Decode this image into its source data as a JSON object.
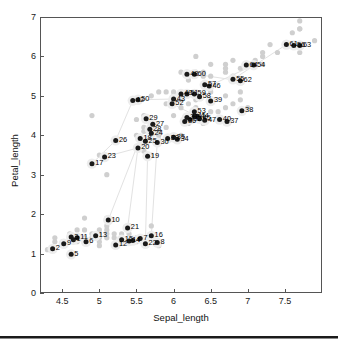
{
  "chart_data": {
    "type": "scatter",
    "title": "",
    "xlabel": "Sepal_length",
    "ylabel": "Petal_length",
    "xlim": [
      4.2,
      8.0
    ],
    "ylim": [
      0,
      7
    ],
    "xticks": [
      4.5,
      5,
      5.5,
      6,
      6.5,
      7,
      7.5
    ],
    "xtick_labels": [
      "4.5",
      "5",
      "5.5",
      "6",
      "6.5",
      "7",
      "7.5"
    ],
    "yticks": [
      0,
      1,
      2,
      3,
      4,
      5,
      6,
      7
    ],
    "ytick_labels": [
      "0",
      "1",
      "2",
      "3",
      "4",
      "5",
      "6",
      "7"
    ],
    "grid": false,
    "legend": "none",
    "colors": {
      "foreground_point": "#1a1a1a",
      "background_point": "#cfcfcf",
      "link_line": "#e2e2e2",
      "axis": "#555555",
      "text": "#111111"
    },
    "series": [
      {
        "name": "background_points",
        "marker": "filled-circle",
        "color": "#cfcfcf",
        "points": [
          {
            "x": 4.3,
            "y": 1.1
          },
          {
            "x": 4.4,
            "y": 1.3
          },
          {
            "x": 4.4,
            "y": 1.4
          },
          {
            "x": 4.5,
            "y": 1.3
          },
          {
            "x": 4.6,
            "y": 1.0
          },
          {
            "x": 4.6,
            "y": 1.4
          },
          {
            "x": 4.6,
            "y": 1.5
          },
          {
            "x": 4.7,
            "y": 1.3
          },
          {
            "x": 4.7,
            "y": 1.6
          },
          {
            "x": 4.8,
            "y": 1.4
          },
          {
            "x": 4.8,
            "y": 1.6
          },
          {
            "x": 4.8,
            "y": 1.9
          },
          {
            "x": 4.9,
            "y": 1.4
          },
          {
            "x": 4.9,
            "y": 1.5
          },
          {
            "x": 4.9,
            "y": 3.3
          },
          {
            "x": 4.9,
            "y": 4.5
          },
          {
            "x": 5.0,
            "y": 1.2
          },
          {
            "x": 5.0,
            "y": 1.3
          },
          {
            "x": 5.0,
            "y": 1.4
          },
          {
            "x": 5.0,
            "y": 1.5
          },
          {
            "x": 5.0,
            "y": 1.6
          },
          {
            "x": 5.0,
            "y": 3.5
          },
          {
            "x": 5.1,
            "y": 1.4
          },
          {
            "x": 5.1,
            "y": 1.5
          },
          {
            "x": 5.1,
            "y": 1.6
          },
          {
            "x": 5.1,
            "y": 1.7
          },
          {
            "x": 5.1,
            "y": 1.9
          },
          {
            "x": 5.1,
            "y": 3.0
          },
          {
            "x": 5.2,
            "y": 1.4
          },
          {
            "x": 5.2,
            "y": 1.5
          },
          {
            "x": 5.2,
            "y": 3.9
          },
          {
            "x": 5.3,
            "y": 1.5
          },
          {
            "x": 5.4,
            "y": 1.3
          },
          {
            "x": 5.4,
            "y": 1.5
          },
          {
            "x": 5.4,
            "y": 1.7
          },
          {
            "x": 5.5,
            "y": 1.3
          },
          {
            "x": 5.5,
            "y": 1.4
          },
          {
            "x": 5.5,
            "y": 3.7
          },
          {
            "x": 5.5,
            "y": 4.0
          },
          {
            "x": 5.5,
            "y": 4.4
          },
          {
            "x": 5.6,
            "y": 3.6
          },
          {
            "x": 5.6,
            "y": 4.1
          },
          {
            "x": 5.6,
            "y": 4.2
          },
          {
            "x": 5.6,
            "y": 4.5
          },
          {
            "x": 5.7,
            "y": 1.5
          },
          {
            "x": 5.7,
            "y": 1.7
          },
          {
            "x": 5.7,
            "y": 3.5
          },
          {
            "x": 5.7,
            "y": 4.1
          },
          {
            "x": 5.7,
            "y": 4.2
          },
          {
            "x": 5.7,
            "y": 5.0
          },
          {
            "x": 5.8,
            "y": 1.2
          },
          {
            "x": 5.8,
            "y": 3.9
          },
          {
            "x": 5.8,
            "y": 4.0
          },
          {
            "x": 5.8,
            "y": 4.1
          },
          {
            "x": 5.8,
            "y": 5.1
          },
          {
            "x": 5.9,
            "y": 4.2
          },
          {
            "x": 5.9,
            "y": 4.8
          },
          {
            "x": 5.9,
            "y": 5.1
          },
          {
            "x": 6.0,
            "y": 4.0
          },
          {
            "x": 6.0,
            "y": 4.5
          },
          {
            "x": 6.0,
            "y": 4.8
          },
          {
            "x": 6.0,
            "y": 5.0
          },
          {
            "x": 6.0,
            "y": 5.1
          },
          {
            "x": 6.1,
            "y": 4.0
          },
          {
            "x": 6.1,
            "y": 4.7
          },
          {
            "x": 6.1,
            "y": 4.9
          },
          {
            "x": 6.1,
            "y": 5.6
          },
          {
            "x": 6.2,
            "y": 4.3
          },
          {
            "x": 6.2,
            "y": 4.5
          },
          {
            "x": 6.2,
            "y": 4.8
          },
          {
            "x": 6.2,
            "y": 5.4
          },
          {
            "x": 6.3,
            "y": 4.4
          },
          {
            "x": 6.3,
            "y": 4.7
          },
          {
            "x": 6.3,
            "y": 4.9
          },
          {
            "x": 6.3,
            "y": 5.0
          },
          {
            "x": 6.3,
            "y": 5.1
          },
          {
            "x": 6.3,
            "y": 5.6
          },
          {
            "x": 6.3,
            "y": 6.0
          },
          {
            "x": 6.4,
            "y": 4.3
          },
          {
            "x": 6.4,
            "y": 4.5
          },
          {
            "x": 6.4,
            "y": 5.3
          },
          {
            "x": 6.4,
            "y": 5.5
          },
          {
            "x": 6.4,
            "y": 5.6
          },
          {
            "x": 6.5,
            "y": 4.6
          },
          {
            "x": 6.5,
            "y": 5.1
          },
          {
            "x": 6.5,
            "y": 5.2
          },
          {
            "x": 6.5,
            "y": 5.5
          },
          {
            "x": 6.5,
            "y": 5.8
          },
          {
            "x": 6.6,
            "y": 4.4
          },
          {
            "x": 6.6,
            "y": 4.6
          },
          {
            "x": 6.7,
            "y": 4.7
          },
          {
            "x": 6.7,
            "y": 5.0
          },
          {
            "x": 6.7,
            "y": 5.6
          },
          {
            "x": 6.7,
            "y": 5.7
          },
          {
            "x": 6.7,
            "y": 5.8
          },
          {
            "x": 6.8,
            "y": 4.8
          },
          {
            "x": 6.8,
            "y": 5.5
          },
          {
            "x": 6.8,
            "y": 5.9
          },
          {
            "x": 6.9,
            "y": 4.9
          },
          {
            "x": 6.9,
            "y": 5.1
          },
          {
            "x": 6.9,
            "y": 5.4
          },
          {
            "x": 6.9,
            "y": 5.7
          },
          {
            "x": 7.0,
            "y": 4.7
          },
          {
            "x": 7.1,
            "y": 5.9
          },
          {
            "x": 7.2,
            "y": 5.8
          },
          {
            "x": 7.2,
            "y": 6.0
          },
          {
            "x": 7.2,
            "y": 6.1
          },
          {
            "x": 7.3,
            "y": 6.3
          },
          {
            "x": 7.4,
            "y": 6.1
          },
          {
            "x": 7.6,
            "y": 6.6
          },
          {
            "x": 7.7,
            "y": 6.1
          },
          {
            "x": 7.7,
            "y": 6.7
          },
          {
            "x": 7.7,
            "y": 6.9
          },
          {
            "x": 7.7,
            "y": 6.7
          },
          {
            "x": 7.9,
            "y": 6.4
          }
        ]
      },
      {
        "name": "labeled_points",
        "marker": "filled-circle",
        "color": "#1a1a1a",
        "points": [
          {
            "id": "1",
            "x": 4.65,
            "y": 1.35
          },
          {
            "id": "2",
            "x": 4.37,
            "y": 1.12
          },
          {
            "id": "3",
            "x": 4.62,
            "y": 1.42
          },
          {
            "id": "4",
            "x": 5.45,
            "y": 1.33
          },
          {
            "id": "5",
            "x": 4.62,
            "y": 0.98
          },
          {
            "id": "6",
            "x": 4.82,
            "y": 1.3
          },
          {
            "id": "7",
            "x": 5.55,
            "y": 1.38
          },
          {
            "id": "8",
            "x": 5.78,
            "y": 1.28
          },
          {
            "id": "9",
            "x": 4.52,
            "y": 1.25
          },
          {
            "id": "10",
            "x": 5.12,
            "y": 1.85
          },
          {
            "id": "11",
            "x": 4.7,
            "y": 1.4
          },
          {
            "id": "12",
            "x": 5.22,
            "y": 1.22
          },
          {
            "id": "13",
            "x": 4.95,
            "y": 1.45
          },
          {
            "id": "14",
            "x": 5.4,
            "y": 1.32
          },
          {
            "id": "15",
            "x": 5.3,
            "y": 1.35
          },
          {
            "id": "16",
            "x": 5.7,
            "y": 1.45
          },
          {
            "id": "17",
            "x": 4.9,
            "y": 3.28
          },
          {
            "id": "18",
            "x": 5.55,
            "y": 3.92
          },
          {
            "id": "19",
            "x": 5.65,
            "y": 3.47
          },
          {
            "id": "20",
            "x": 5.52,
            "y": 3.68
          },
          {
            "id": "21",
            "x": 5.38,
            "y": 1.65
          },
          {
            "id": "22",
            "x": 5.62,
            "y": 1.25
          },
          {
            "id": "23",
            "x": 5.07,
            "y": 3.45
          },
          {
            "id": "24",
            "x": 5.7,
            "y": 4.05
          },
          {
            "id": "25",
            "x": 5.62,
            "y": 3.85
          },
          {
            "id": "26",
            "x": 5.22,
            "y": 3.87
          },
          {
            "id": "27",
            "x": 5.72,
            "y": 4.28
          },
          {
            "id": "28",
            "x": 5.68,
            "y": 4.15
          },
          {
            "id": "29",
            "x": 5.63,
            "y": 4.42
          },
          {
            "id": "30",
            "x": 5.78,
            "y": 3.82
          },
          {
            "id": "31",
            "x": 6.18,
            "y": 4.45
          },
          {
            "id": "32",
            "x": 6.22,
            "y": 4.4
          },
          {
            "id": "33",
            "x": 5.92,
            "y": 3.92
          },
          {
            "id": "34",
            "x": 6.05,
            "y": 3.9
          },
          {
            "id": "35",
            "x": 6.0,
            "y": 3.95
          },
          {
            "id": "36",
            "x": 6.15,
            "y": 4.35
          },
          {
            "id": "37",
            "x": 6.72,
            "y": 4.35
          },
          {
            "id": "38",
            "x": 6.92,
            "y": 4.62
          },
          {
            "id": "39",
            "x": 6.5,
            "y": 4.87
          },
          {
            "id": "40",
            "x": 6.62,
            "y": 4.4
          },
          {
            "id": "41",
            "x": 6.28,
            "y": 4.48
          },
          {
            "id": "42",
            "x": 5.45,
            "y": 4.88
          },
          {
            "id": "43",
            "x": 6.0,
            "y": 4.92
          },
          {
            "id": "44",
            "x": 6.32,
            "y": 4.48
          },
          {
            "id": "45",
            "x": 6.35,
            "y": 4.42
          },
          {
            "id": "46",
            "x": 6.48,
            "y": 5.25
          },
          {
            "id": "47",
            "x": 6.42,
            "y": 4.38
          },
          {
            "id": "48",
            "x": 6.18,
            "y": 5.55
          },
          {
            "id": "49",
            "x": 6.1,
            "y": 5.05
          },
          {
            "id": "50",
            "x": 5.52,
            "y": 4.9
          },
          {
            "id": "51",
            "x": 6.18,
            "y": 5.05
          },
          {
            "id": "52",
            "x": 5.98,
            "y": 4.8
          },
          {
            "id": "53",
            "x": 6.28,
            "y": 4.6
          },
          {
            "id": "54",
            "x": 7.08,
            "y": 5.78
          },
          {
            "id": "55",
            "x": 6.8,
            "y": 5.42
          },
          {
            "id": "56",
            "x": 7.62,
            "y": 6.28
          },
          {
            "id": "57",
            "x": 6.42,
            "y": 5.28
          },
          {
            "id": "58",
            "x": 6.35,
            "y": 4.98
          },
          {
            "id": "59",
            "x": 6.28,
            "y": 5.05
          },
          {
            "id": "60",
            "x": 6.28,
            "y": 5.55
          },
          {
            "id": "61",
            "x": 7.52,
            "y": 6.3
          },
          {
            "id": "62",
            "x": 6.9,
            "y": 5.38
          },
          {
            "id": "63",
            "x": 7.7,
            "y": 6.28
          },
          {
            "id": "64",
            "x": 6.98,
            "y": 5.78
          }
        ]
      }
    ],
    "link_lines": [
      {
        "x1": 5.22,
        "y1": 3.87,
        "x2": 5.45,
        "y2": 4.88
      },
      {
        "x1": 5.52,
        "y1": 4.9,
        "x2": 6.0,
        "y2": 4.92
      },
      {
        "x1": 5.55,
        "y1": 3.92,
        "x2": 5.78,
        "y2": 3.82
      },
      {
        "x1": 5.38,
        "y1": 1.65,
        "x2": 5.52,
        "y2": 3.68
      },
      {
        "x1": 5.12,
        "y1": 1.85,
        "x2": 5.55,
        "y2": 3.92
      },
      {
        "x1": 5.62,
        "y1": 1.25,
        "x2": 5.65,
        "y2": 3.47
      },
      {
        "x1": 5.7,
        "y1": 1.45,
        "x2": 5.78,
        "y2": 3.82
      },
      {
        "x1": 4.9,
        "y1": 3.28,
        "x2": 5.22,
        "y2": 3.87
      },
      {
        "x1": 6.18,
        "y1": 4.45,
        "x2": 6.72,
        "y2": 4.35
      },
      {
        "x1": 6.48,
        "y1": 5.25,
        "x2": 7.08,
        "y2": 5.78
      },
      {
        "x1": 6.8,
        "y1": 5.42,
        "x2": 7.52,
        "y2": 6.3
      },
      {
        "x1": 5.45,
        "y1": 1.33,
        "x2": 5.55,
        "y2": 1.38
      },
      {
        "x1": 5.07,
        "y1": 3.45,
        "x2": 5.52,
        "y2": 3.68
      },
      {
        "x1": 6.28,
        "y1": 5.55,
        "x2": 6.9,
        "y2": 5.38
      },
      {
        "x1": 5.98,
        "y1": 4.8,
        "x2": 6.42,
        "y2": 4.38
      }
    ]
  }
}
